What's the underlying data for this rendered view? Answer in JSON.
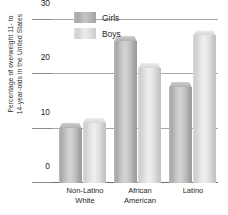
{
  "chart_data": {
    "type": "bar",
    "title": "",
    "xlabel": "",
    "ylabel": "Percentage of overweight 11- to 14-year-olds in the United States",
    "ylabel_lines": [
      "Percentage of overweight 11- to",
      "14-year-olds in the United States"
    ],
    "categories": [
      "Non-Latino White",
      "African American",
      "Latino"
    ],
    "category_lines": [
      [
        "Non-Latino",
        "White"
      ],
      [
        "African",
        "American"
      ],
      [
        "Latino",
        ""
      ]
    ],
    "series": [
      {
        "name": "Girls",
        "values": [
          11,
          27,
          18.5
        ],
        "color": "#b5b5b5"
      },
      {
        "name": "Boys",
        "values": [
          12,
          22,
          28
        ],
        "color": "#dcdcdc"
      }
    ],
    "ylim": [
      0,
      31
    ],
    "yticks": [
      0,
      10,
      20,
      30
    ],
    "ytick_labels": [
      "0",
      "10",
      "20",
      "30"
    ],
    "grid": true,
    "legend_position": "top-center"
  },
  "legend": {
    "items": [
      {
        "label": "Girls",
        "swatch": "girls-swatch"
      },
      {
        "label": "Boys",
        "swatch": "boys-swatch"
      }
    ]
  },
  "axis": {
    "y_title_line1": "Percentage of overweight 11- to",
    "y_title_line2": "14-year-olds in the United States",
    "y_ticks": [
      "30",
      "20",
      "10",
      "0"
    ]
  },
  "x_axis": {
    "groups": [
      {
        "line1": "Non-Latino",
        "line2": "White"
      },
      {
        "line1": "African",
        "line2": "American"
      },
      {
        "line1": "Latino",
        "line2": ""
      }
    ]
  }
}
